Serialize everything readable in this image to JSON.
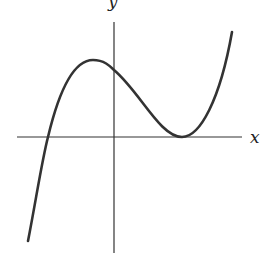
{
  "diagram": {
    "type": "function-graph",
    "axes": {
      "x_label": "x",
      "y_label": "y"
    },
    "curve": {
      "description": "cubic with local max left of y-axis, double root tangent to x-axis on the right",
      "features": [
        "x-intercept on negative x",
        "local maximum at negative x",
        "positive y-intercept",
        "tangent to x-axis at positive x (double root)"
      ]
    },
    "colors": {
      "stroke": "#333333",
      "background": "#ffffff"
    }
  }
}
